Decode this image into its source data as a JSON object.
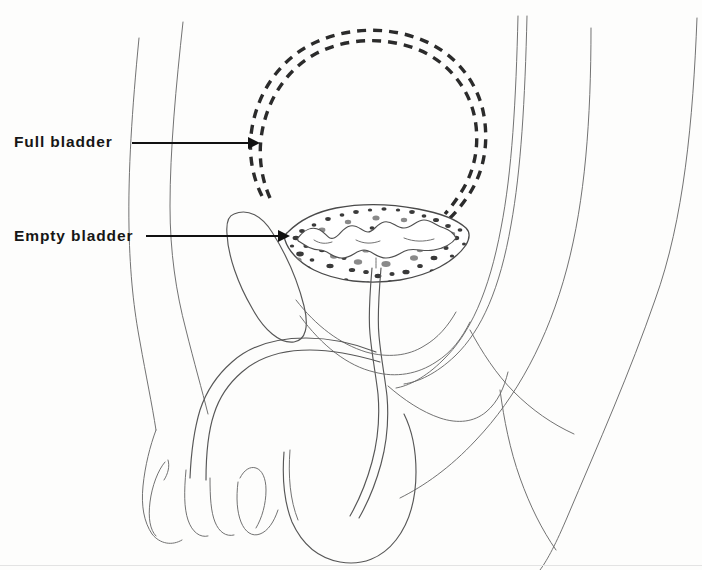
{
  "figure": {
    "type": "medical-line-illustration",
    "view": "midsagittal",
    "background_color": "#fdfdfc",
    "line_color": "#575757",
    "dash_color": "#2b2b2b",
    "label_color": "#161616"
  },
  "labels": [
    {
      "id": "full-bladder",
      "text": "Full bladder",
      "leader": {
        "from_x": 132,
        "to_x": 258,
        "y": 143,
        "arrow": "right"
      },
      "points_to": "distended bladder outline (dashed)"
    },
    {
      "id": "empty-bladder",
      "text": "Empty bladder",
      "leader": {
        "from_x": 146,
        "to_x": 288,
        "y": 236,
        "arrow": "right"
      },
      "points_to": "collapsed bladder with mucosal rugae"
    }
  ],
  "structures": [
    {
      "name": "full-bladder-outline",
      "style": "double dashed circle",
      "center_x": 368,
      "center_y": 148,
      "radius": 108
    },
    {
      "name": "empty-bladder",
      "style": "crescent with stippled wall and wavy mucosa"
    },
    {
      "name": "anterior-abdominal-wall",
      "style": "thin contour lines"
    },
    {
      "name": "pubic-symphysis",
      "style": "elongated oval"
    },
    {
      "name": "urethra",
      "style": "narrow double-line tube"
    },
    {
      "name": "penis",
      "style": "contour with glans"
    },
    {
      "name": "scrotum-testis",
      "style": "rounded contour"
    },
    {
      "name": "rectum-sacrum",
      "style": "posterior parallel contours"
    }
  ]
}
